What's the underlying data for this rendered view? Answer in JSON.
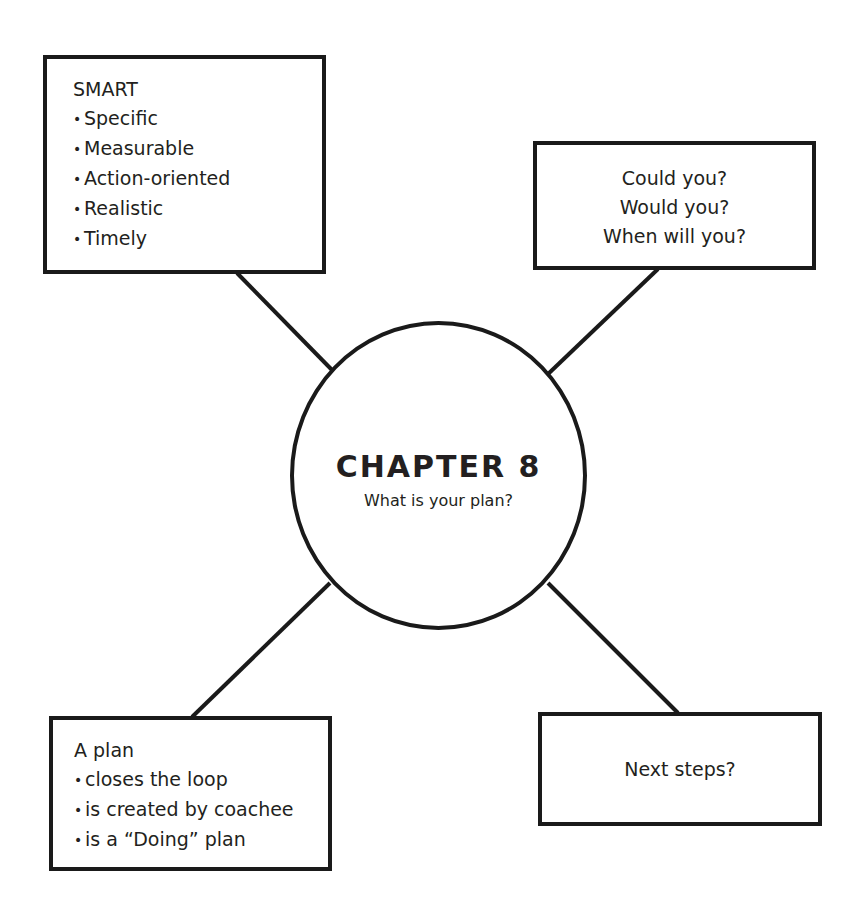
{
  "diagram": {
    "type": "mind-map",
    "colors": {
      "stroke": "#1a1a1a",
      "text": "#231f20",
      "background": "#ffffff"
    },
    "hub": {
      "title": "CHAPTER 8",
      "subtitle": "What is your plan?"
    },
    "nodes": {
      "top_left": {
        "heading": "SMART",
        "bullet": "•",
        "items": [
          "Specific",
          "Measurable",
          "Action-oriented",
          "Realistic",
          "Timely"
        ]
      },
      "top_right": {
        "lines": [
          "Could you?",
          "Would you?",
          "When will you?"
        ]
      },
      "bottom_left": {
        "heading": "A plan",
        "bullet": "•",
        "items": [
          "closes the loop",
          "is created by coachee",
          "is a “Doing” plan"
        ]
      },
      "bottom_right": {
        "text": "Next steps?"
      }
    }
  }
}
